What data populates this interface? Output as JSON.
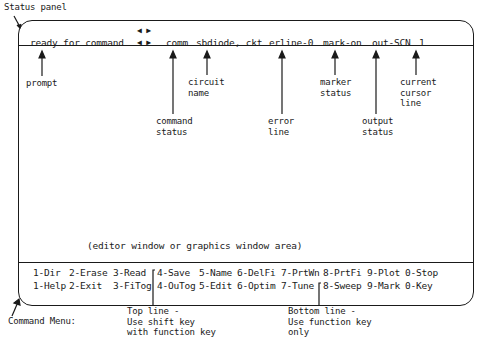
{
  "diagram": {
    "title_label": "Status panel",
    "status_bar": {
      "scroll_arrows_top": "◀ ▶",
      "prompt": "ready for command",
      "scroll_arrows": "◀ ▶",
      "command_status": "comm",
      "circuit_name": "sbdiode, ckt",
      "error_line": "erline-0",
      "marker_status": "mark-on",
      "output_status": "out-SCN",
      "cursor_line": "1"
    },
    "annotations": {
      "prompt": "prompt",
      "circuit_name": "circuit\nname",
      "command_status": "command\nstatus",
      "error_line": "error\nline",
      "marker_status": "marker\nstatus",
      "output_status": "output\nstatus",
      "cursor_line": "current\ncursor\nline"
    },
    "work_area_label": "(editor window or graphics window area)",
    "command_menu": {
      "top_row": [
        "1-Dir",
        "2-Erase",
        "3-Read",
        "4-Save",
        "5-Name",
        "6-DelFi",
        "7-PrtWn",
        "8-PrtFi",
        "9-Plot",
        "0-Stop"
      ],
      "bottom_row": [
        "1-Help",
        "2-Exit",
        "3-FiTog",
        "4-OuTog",
        "5-Edit",
        "6-Optim",
        "7-Tune",
        "8-Sweep",
        "9-Mark",
        "0-Key"
      ]
    },
    "footer_labels": {
      "command_menu": "Command Menu:",
      "top_line": "Top line -\nUse shift key\nwith function key",
      "bottom_line": "Bottom line -\nUse function key\nonly"
    }
  }
}
